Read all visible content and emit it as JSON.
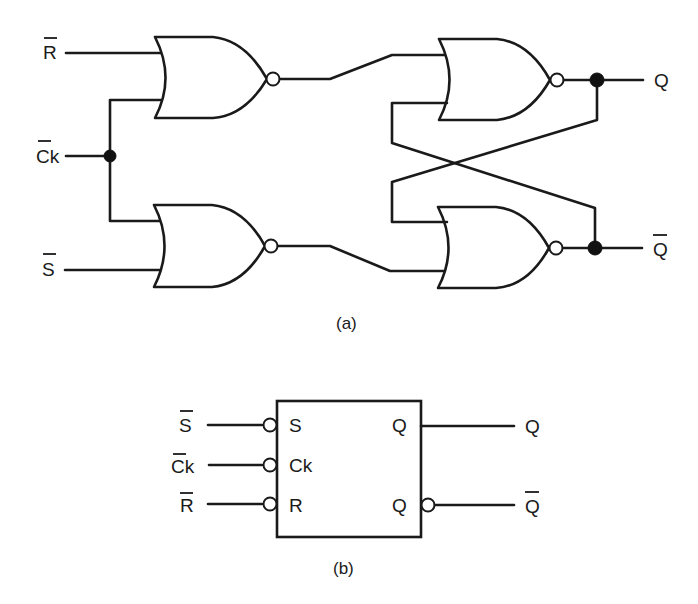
{
  "figure_a": {
    "caption": "(a)",
    "inputs": [
      {
        "id": "r_bar",
        "label": "R",
        "overbar": true
      },
      {
        "id": "ck_bar",
        "label": "Ck",
        "overbar": true
      },
      {
        "id": "s_bar",
        "label": "S",
        "overbar": true
      }
    ],
    "outputs": [
      {
        "id": "q",
        "label": "Q",
        "overbar": false
      },
      {
        "id": "q_bar",
        "label": "Q",
        "overbar": true
      }
    ],
    "gates": [
      {
        "id": "nor-1",
        "type": "NOR",
        "inputs": [
          "R̄",
          "C̄k"
        ]
      },
      {
        "id": "nor-2",
        "type": "NOR",
        "inputs": [
          "C̄k",
          "S̄"
        ]
      },
      {
        "id": "nor-3",
        "type": "NOR",
        "inputs": [
          "nor-1 out",
          "Q̄ feedback"
        ],
        "output": "Q"
      },
      {
        "id": "nor-4",
        "type": "NOR",
        "inputs": [
          "Q feedback",
          "nor-2 out"
        ],
        "output": "Q̄"
      }
    ]
  },
  "figure_b": {
    "caption": "(b)",
    "external_inputs": [
      {
        "label": "S",
        "overbar": true
      },
      {
        "label": "Ck",
        "overbar": true
      },
      {
        "label": "R",
        "overbar": true
      }
    ],
    "pins_left": [
      "S",
      "Ck",
      "R"
    ],
    "pins_right": [
      "Q",
      "Q"
    ],
    "external_outputs": [
      {
        "label": "Q",
        "overbar": false
      },
      {
        "label": "Q",
        "overbar": true
      }
    ]
  }
}
